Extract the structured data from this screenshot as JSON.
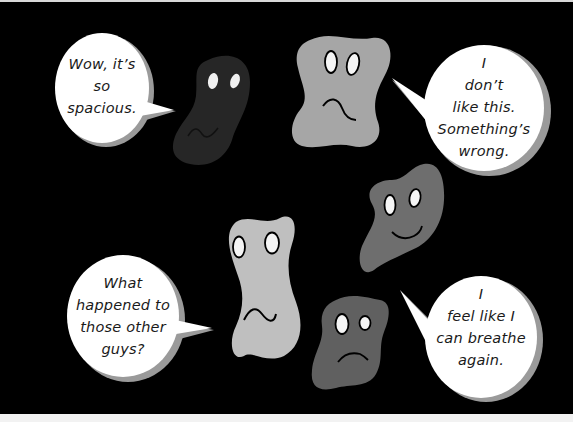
{
  "colors": {
    "background": "#000000",
    "bubble_fill": "#ffffff",
    "bubble_shadow": "#9a9a9a",
    "blob_darkest": "#262626",
    "blob_light": "#a6a6a6",
    "blob_lighter": "#bfbfbf",
    "blob_medium": "#6e6e6e",
    "blob_dark": "#606060",
    "eye_fill": "#f5f5f5",
    "line": "#000000"
  },
  "bubbles": [
    {
      "id": "top-left",
      "lines": [
        "Wow, it’s",
        "so",
        "spacious."
      ]
    },
    {
      "id": "top-right",
      "lines": [
        "I",
        "don’t",
        "like this.",
        "Something’s",
        "wrong."
      ]
    },
    {
      "id": "bottom-left",
      "lines": [
        "What",
        "happened to",
        "those other",
        "guys?"
      ]
    },
    {
      "id": "bottom-right",
      "lines": [
        "I",
        "feel like I",
        "can breathe",
        "again."
      ]
    }
  ],
  "characters": [
    {
      "id": "dark-blob",
      "shade": "darkest",
      "expression": "wavy-worried"
    },
    {
      "id": "gray-blob-top",
      "shade": "light",
      "expression": "frown"
    },
    {
      "id": "gray-blob-right",
      "shade": "medium",
      "expression": "smile"
    },
    {
      "id": "light-blob-center",
      "shade": "lighter",
      "expression": "wavy-worried"
    },
    {
      "id": "dark-gray-blob-bottom",
      "shade": "dark",
      "expression": "frown"
    }
  ]
}
